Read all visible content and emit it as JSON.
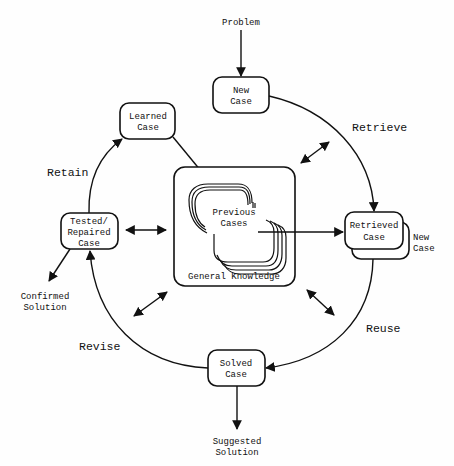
{
  "diagram": {
    "input": "Problem",
    "nodes": {
      "new_case": [
        "New",
        "Case"
      ],
      "learned_case": [
        "Learned",
        "Case"
      ],
      "retrieved_case": [
        "Retrieved",
        "Case"
      ],
      "retrieved_new_case": [
        "New",
        "Case"
      ],
      "tested_case": [
        "Tested/",
        "Repaired",
        "Case"
      ],
      "solved_case": [
        "Solved",
        "Case"
      ],
      "previous_cases": [
        "Previous",
        "Cases"
      ],
      "general_knowledge": "General Knowledge"
    },
    "processes": {
      "retrieve": "Retrieve",
      "reuse": "Reuse",
      "revise": "Revise",
      "retain": "Retain"
    },
    "outputs": {
      "confirmed": [
        "Confirmed",
        "Solution"
      ],
      "suggested": [
        "Suggested",
        "Solution"
      ]
    },
    "colors": {
      "stroke": "#111111",
      "background": "#fefefe"
    }
  }
}
